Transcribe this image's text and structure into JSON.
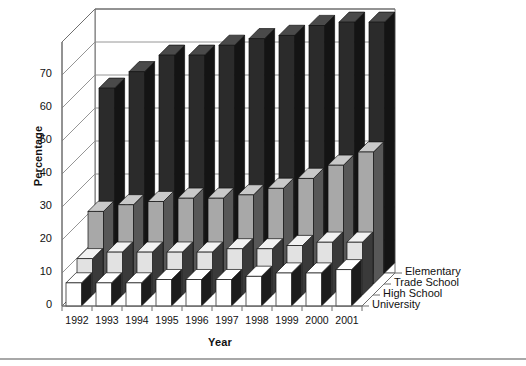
{
  "chart_data": {
    "type": "bar",
    "title": "",
    "subtitle": "",
    "xlabel": "Year",
    "ylabel": "Percentage",
    "categories": [
      "1992",
      "1993",
      "1994",
      "1995",
      "1996",
      "1997",
      "1998",
      "1999",
      "2000",
      "2001"
    ],
    "ylim": [
      0,
      70
    ],
    "yticks": [
      0,
      10,
      20,
      30,
      40,
      50,
      60,
      70
    ],
    "ytick_labels": [
      "0",
      "10",
      "20",
      "30",
      "40",
      "50",
      "60",
      "70"
    ],
    "grid": true,
    "grid_axis": "y",
    "legend_position": "right-depth-axis",
    "projection": "3d-grouped-depth",
    "series": [
      {
        "name": "University",
        "color": "#ffffff",
        "depth_index": 0,
        "values": [
          7,
          7,
          7,
          8,
          8,
          8,
          9,
          10,
          10,
          11
        ]
      },
      {
        "name": "High School",
        "color": "#e2e2e2",
        "depth_index": 1,
        "values": [
          11,
          13,
          13,
          13,
          13,
          14,
          14,
          15,
          16,
          16
        ]
      },
      {
        "name": "Trade School",
        "color": "#a8a8a8",
        "depth_index": 2,
        "values": [
          22,
          24,
          25,
          26,
          26,
          27,
          29,
          32,
          36,
          40
        ]
      },
      {
        "name": "Elementary",
        "color": "#2b2b2b",
        "depth_index": 3,
        "values": [
          56,
          61,
          66,
          66,
          69,
          71,
          72,
          75,
          76,
          76
        ]
      }
    ]
  },
  "axis": {
    "y_title": "Percentage",
    "x_title": "Year"
  }
}
